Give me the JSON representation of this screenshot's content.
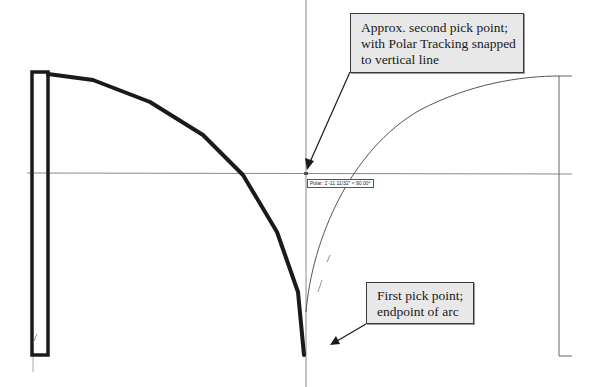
{
  "callouts": {
    "second_pick": {
      "lines": [
        "Approx. second pick point;",
        "with Polar Tracking snapped",
        "to vertical line"
      ]
    },
    "first_pick": {
      "lines": [
        "First pick point;",
        "endpoint of arc"
      ]
    }
  },
  "tooltip": {
    "text": "Polar: 1'-11 11/32\" < 90.00°"
  },
  "colors": {
    "background": "#ffffff",
    "geometry_thick": "#1a1a1a",
    "construction_line": "#888888",
    "arc_thin": "#555555",
    "callout_fill": "#e8e8e8",
    "callout_border": "#3a3a3a"
  }
}
